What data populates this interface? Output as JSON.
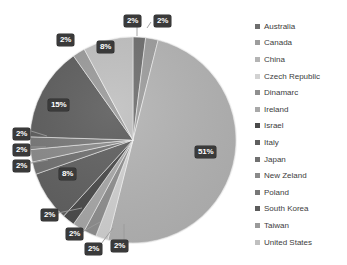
{
  "chart_data": {
    "type": "pie",
    "title": "",
    "legend_position": "right",
    "categories": [
      "Australia",
      "Canada",
      "China",
      "Czech Republic",
      "Dinamarc",
      "Ireland",
      "Israel",
      "Italy",
      "Japan",
      "New Zeland",
      "Poland",
      "South Korea",
      "Taiwan",
      "United States"
    ],
    "values": [
      2,
      2,
      51,
      2,
      2,
      2,
      2,
      8,
      2,
      2,
      2,
      15,
      2,
      8
    ],
    "labels": [
      "2%",
      "2%",
      "51%",
      "2%",
      "2%",
      "2%",
      "2%",
      "8%",
      "2%",
      "2%",
      "2%",
      "15%",
      "2%",
      "8%"
    ],
    "colors": [
      "#6e6e6e",
      "#9d9d9d",
      "#b4b4b4",
      "#cfcfcf",
      "#8f8f8f",
      "#a8a8a8",
      "#4f4f4f",
      "#757575",
      "#626262",
      "#5a5a5a",
      "#848484",
      "#6a6a6a",
      "#9a9a9a",
      "#c2c2c2"
    ],
    "slices": [
      {
        "name": "Australia",
        "label": "2%",
        "value": 2,
        "color": "#6e6e6e"
      },
      {
        "name": "Canada",
        "label": "2%",
        "value": 2,
        "color": "#9d9d9d"
      },
      {
        "name": "China",
        "label": "51%",
        "value": 51,
        "color": "#b4b4b4"
      },
      {
        "name": "Czech Republic",
        "label": "2%",
        "value": 2,
        "color": "#d2d2d2"
      },
      {
        "name": "Dinamarc",
        "label": "2%",
        "value": 2,
        "color": "#8f8f8f"
      },
      {
        "name": "Ireland",
        "label": "2%",
        "value": 2,
        "color": "#a8a8a8"
      },
      {
        "name": "Israel",
        "label": "2%",
        "value": 2,
        "color": "#4a4a4a"
      },
      {
        "name": "Italy",
        "label": "8%",
        "value": 8,
        "color": "#5f5f5f"
      },
      {
        "name": "Japan",
        "label": "2%",
        "value": 2,
        "color": "#707070"
      },
      {
        "name": "New Zeland",
        "label": "2%",
        "value": 2,
        "color": "#8a8a8a"
      },
      {
        "name": "Poland",
        "label": "2%",
        "value": 2,
        "color": "#777777"
      },
      {
        "name": "South Korea",
        "label": "15%",
        "value": 15,
        "color": "#5c5c5c"
      },
      {
        "name": "Taiwan",
        "label": "2%",
        "value": 2,
        "color": "#9a9a9a"
      },
      {
        "name": "United States",
        "label": "8%",
        "value": 8,
        "color": "#c0c0c0"
      }
    ]
  },
  "legend": {
    "items": [
      {
        "label": "Australia",
        "color": "#6e6e6e"
      },
      {
        "label": "Canada",
        "color": "#9d9d9d"
      },
      {
        "label": "China",
        "color": "#b4b4b4"
      },
      {
        "label": "Czech Republic",
        "color": "#d2d2d2"
      },
      {
        "label": "Dinamarc",
        "color": "#8f8f8f"
      },
      {
        "label": "Ireland",
        "color": "#a8a8a8"
      },
      {
        "label": "Israel",
        "color": "#4a4a4a"
      },
      {
        "label": "Italy",
        "color": "#5f5f5f"
      },
      {
        "label": "Japan",
        "color": "#707070"
      },
      {
        "label": "New Zeland",
        "color": "#8a8a8a"
      },
      {
        "label": "Poland",
        "color": "#777777"
      },
      {
        "label": "South Korea",
        "color": "#5c5c5c"
      },
      {
        "label": "Taiwan",
        "color": "#9a9a9a"
      },
      {
        "label": "United States",
        "color": "#c0c0c0"
      }
    ]
  },
  "data_labels": [
    {
      "text": "2%",
      "x": 124,
      "y": 15
    },
    {
      "text": "2%",
      "x": 154,
      "y": 15
    },
    {
      "text": "51%",
      "x": 195,
      "y": 146
    },
    {
      "text": "2%",
      "x": 111,
      "y": 240
    },
    {
      "text": "2%",
      "x": 85,
      "y": 243
    },
    {
      "text": "2%",
      "x": 66,
      "y": 228
    },
    {
      "text": "2%",
      "x": 41,
      "y": 209
    },
    {
      "text": "8%",
      "x": 59,
      "y": 168
    },
    {
      "text": "2%",
      "x": 13,
      "y": 160
    },
    {
      "text": "2%",
      "x": 13,
      "y": 144
    },
    {
      "text": "2%",
      "x": 13,
      "y": 128
    },
    {
      "text": "15%",
      "x": 48,
      "y": 99
    },
    {
      "text": "2%",
      "x": 57,
      "y": 34
    },
    {
      "text": "8%",
      "x": 97,
      "y": 41
    }
  ]
}
